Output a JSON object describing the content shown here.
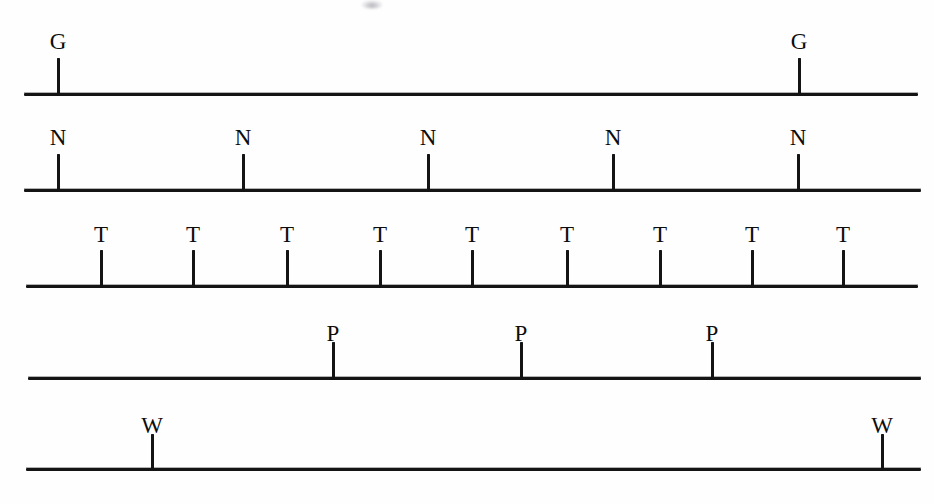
{
  "page": {
    "width": 935,
    "height": 504,
    "background_color": "#fefefe",
    "ink_color": "#141414"
  },
  "artifact": {
    "name": "scan-smudge",
    "x": 372,
    "y": 4
  },
  "rows": [
    {
      "id": "row-g",
      "label": "G",
      "line_y": 96,
      "line_x_start": 24,
      "line_x_end": 918,
      "tick_height": 38,
      "label_baseline_y": 48,
      "count": 2,
      "tick_positions": [
        58,
        799
      ],
      "marks": [
        {
          "label": "G",
          "x": 58
        },
        {
          "label": "G",
          "x": 799
        }
      ]
    },
    {
      "id": "row-n",
      "label": "N",
      "line_y": 192,
      "line_x_start": 24,
      "line_x_end": 921,
      "tick_height": 38,
      "label_baseline_y": 144,
      "count": 5,
      "tick_positions": [
        58,
        243,
        428,
        613,
        798
      ],
      "marks": [
        {
          "label": "N",
          "x": 58
        },
        {
          "label": "N",
          "x": 243
        },
        {
          "label": "N",
          "x": 428
        },
        {
          "label": "N",
          "x": 613
        },
        {
          "label": "N",
          "x": 798
        }
      ]
    },
    {
      "id": "row-t",
      "label": "T",
      "line_y": 288,
      "line_x_start": 26,
      "line_x_end": 918,
      "tick_height": 38,
      "label_baseline_y": 241,
      "count": 9,
      "tick_positions": [
        101,
        193,
        287,
        380,
        472,
        567,
        660,
        752,
        843
      ],
      "marks": [
        {
          "label": "T",
          "x": 101
        },
        {
          "label": "T",
          "x": 193
        },
        {
          "label": "T",
          "x": 287
        },
        {
          "label": "T",
          "x": 380
        },
        {
          "label": "T",
          "x": 472
        },
        {
          "label": "T",
          "x": 567
        },
        {
          "label": "T",
          "x": 660
        },
        {
          "label": "T",
          "x": 752
        },
        {
          "label": "T",
          "x": 843
        }
      ]
    },
    {
      "id": "row-p",
      "label": "P",
      "line_y": 380,
      "line_x_start": 28,
      "line_x_end": 921,
      "tick_height": 38,
      "label_baseline_y": 340,
      "count": 3,
      "tick_positions": [
        333,
        521,
        712
      ],
      "marks": [
        {
          "label": "P",
          "x": 333
        },
        {
          "label": "P",
          "x": 521
        },
        {
          "label": "P",
          "x": 712
        }
      ]
    },
    {
      "id": "row-w",
      "label": "W",
      "line_y": 471,
      "line_x_start": 26,
      "line_x_end": 921,
      "tick_height": 37,
      "label_baseline_y": 432,
      "count": 2,
      "tick_positions": [
        152,
        882
      ],
      "marks": [
        {
          "label": "W",
          "x": 152
        },
        {
          "label": "W",
          "x": 882
        }
      ]
    }
  ]
}
